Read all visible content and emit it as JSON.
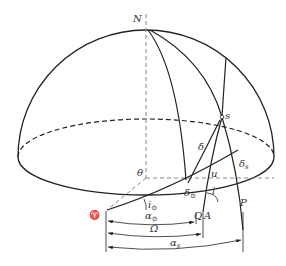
{
  "diagram": {
    "type": "celestial-sphere-hemisphere",
    "labels": {
      "north_pole": "N",
      "satellite": "s",
      "declination": "δ",
      "sat_declination": "δ",
      "sat_declination_sub": "s",
      "argument": "u",
      "angle_theta": "θ",
      "sun_declination": "δ",
      "sun_declination_sub": "⊙",
      "inclination": "i",
      "sun_inclination": "i",
      "sun_inclination_sub": "⊙",
      "vernal_equinox": "♈",
      "point_q": "Q",
      "point_a": "A",
      "point_p": "P",
      "sun_right_ascension": "α",
      "sun_right_ascension_sub": "⊙",
      "raan": "Ω",
      "sat_right_ascension": "α",
      "sat_right_ascension_sub": "s"
    },
    "colors": {
      "line": "#222222",
      "dashed": "#888888",
      "text": "#333333"
    }
  }
}
